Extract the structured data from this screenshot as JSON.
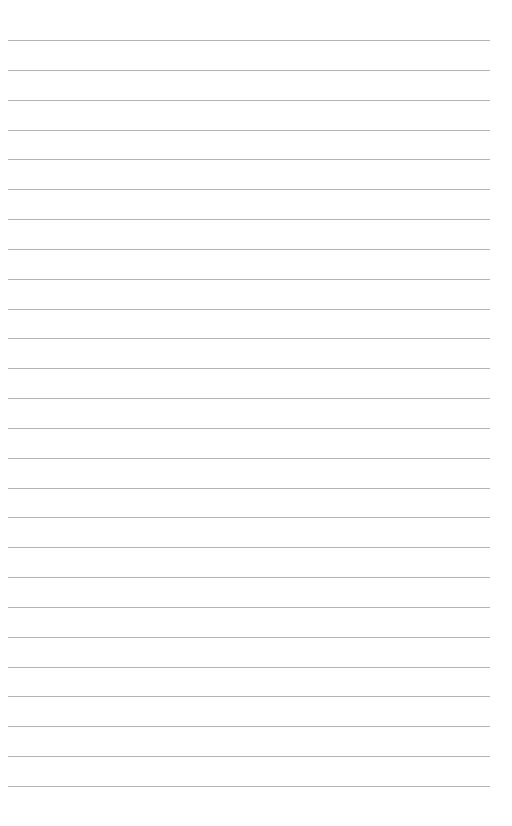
{
  "page": {
    "type": "lined-paper",
    "background_color": "#ffffff",
    "line_color": "#b4b4b4",
    "line_count": 26,
    "first_line_y": 40,
    "line_spacing": 29.84,
    "line_left": 8,
    "line_right": 490,
    "lines": [
      "",
      "",
      "",
      "",
      "",
      "",
      "",
      "",
      "",
      "",
      "",
      "",
      "",
      "",
      "",
      "",
      "",
      "",
      "",
      "",
      "",
      "",
      "",
      "",
      "",
      ""
    ]
  }
}
